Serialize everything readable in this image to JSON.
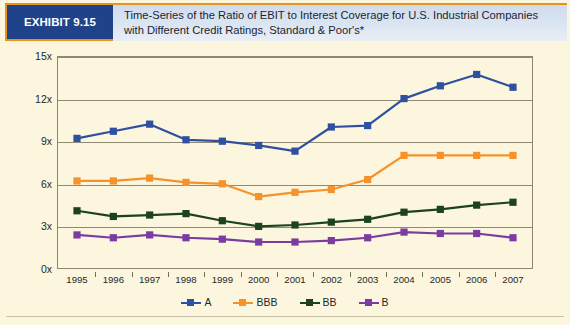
{
  "header": {
    "exhibit_label": "EXHIBIT 9.15",
    "title_line1": "Time-Series of the Ratio of EBIT to Interest Coverage for U.S. Industrial Companies",
    "title_line2": "with Different Credit Ratings, Standard & Poor's*",
    "badge_color": "#1f4289",
    "badge_border_color": "#e7941f",
    "band_color": "#d6e1ef"
  },
  "chart_data": {
    "type": "line",
    "title": "Time-Series of the Ratio of EBIT to Interest Coverage for U.S. Industrial Companies with Different Credit Ratings, Standard & Poor's*",
    "xlabel": "",
    "ylabel": "",
    "x": [
      "1995",
      "1996",
      "1997",
      "1998",
      "1999",
      "2000",
      "2001",
      "2002",
      "2003",
      "2004",
      "2005",
      "2006",
      "2007"
    ],
    "categories": [
      "1995",
      "1996",
      "1997",
      "1998",
      "1999",
      "2000",
      "2001",
      "2002",
      "2003",
      "2004",
      "2005",
      "2006",
      "2007"
    ],
    "ylim": [
      0,
      15
    ],
    "yticks": [
      0,
      3,
      6,
      9,
      12,
      15
    ],
    "ytick_labels": [
      "0x",
      "3x",
      "6x",
      "9x",
      "12x",
      "15x"
    ],
    "grid": true,
    "legend_position": "bottom",
    "series": [
      {
        "name": "A",
        "color": "#2f4fa0",
        "values": [
          9.2,
          9.7,
          10.2,
          9.1,
          9.0,
          8.7,
          8.3,
          10.0,
          10.1,
          12.0,
          12.9,
          13.7,
          12.8
        ]
      },
      {
        "name": "BBB",
        "color": "#f5922b",
        "values": [
          6.2,
          6.2,
          6.4,
          6.1,
          6.0,
          5.1,
          5.4,
          5.6,
          6.3,
          8.0,
          8.0,
          8.0,
          8.0
        ]
      },
      {
        "name": "BB",
        "color": "#1d4220",
        "values": [
          4.1,
          3.7,
          3.8,
          3.9,
          3.4,
          3.0,
          3.1,
          3.3,
          3.5,
          4.0,
          4.2,
          4.5,
          4.7
        ]
      },
      {
        "name": "B",
        "color": "#7a3ca0",
        "values": [
          2.4,
          2.2,
          2.4,
          2.2,
          2.1,
          1.9,
          1.9,
          2.0,
          2.2,
          2.6,
          2.5,
          2.5,
          2.2
        ]
      }
    ]
  },
  "legend": {
    "items": [
      {
        "label": "A",
        "color": "#2f4fa0"
      },
      {
        "label": "BBB",
        "color": "#f5922b"
      },
      {
        "label": "BB",
        "color": "#1d4220"
      },
      {
        "label": "B",
        "color": "#7a3ca0"
      }
    ]
  },
  "colors": {
    "background": "#fbf6dd",
    "gridline": "#8e8a73",
    "axis": "#8b8770",
    "text": "#24282c"
  }
}
